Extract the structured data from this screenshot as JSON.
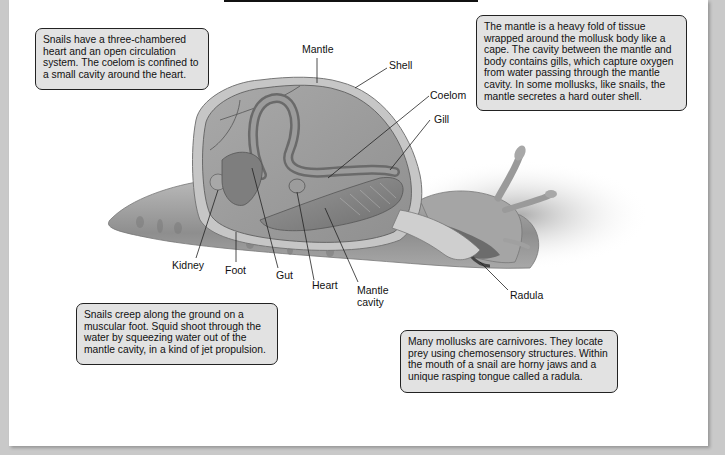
{
  "diagram": {
    "callouts": {
      "circulation": "Snails have a three-chambered heart and an open circulation system. The coelom is confined to a small cavity around the heart.",
      "mantle": "The mantle is a heavy fold of tissue wrapped around the mollusk body like a cape. The cavity between the mantle and body contains gills, which capture oxygen from water passing through the mantle cavity. In some mollusks, like snails, the mantle secretes a hard outer shell.",
      "locomotion": "Snails creep along the ground on a muscular foot. Squid shoot through the water by squeezing water out of the mantle cavity, in a kind of jet propulsion.",
      "feeding": "Many mollusks are carnivores. They locate prey using chemosensory structures. Within the mouth of a snail are horny jaws and a unique rasping tongue called a radula."
    },
    "labels": {
      "mantle": "Mantle",
      "shell": "Shell",
      "coelom": "Coelom",
      "gill": "Gill",
      "kidney": "Kidney",
      "foot": "Foot",
      "gut": "Gut",
      "heart": "Heart",
      "mantle_cavity_1": "Mantle",
      "mantle_cavity_2": "cavity",
      "radula": "Radula"
    },
    "colors": {
      "callout_fill": "#e2e2e2",
      "callout_border": "#222222",
      "background": "#ffffff",
      "frame_shadow": "#c9c9c9"
    }
  }
}
